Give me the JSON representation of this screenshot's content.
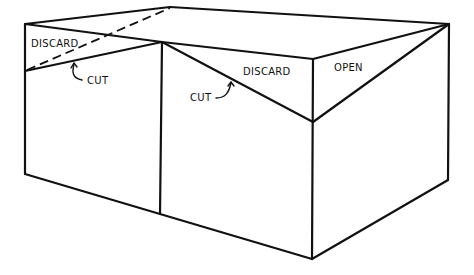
{
  "diagram": {
    "type": "line-drawing",
    "stroke_color": "#111111",
    "background": "#ffffff",
    "labels": {
      "discard_left": "DISCARD",
      "cut_left": "CUT",
      "discard_right": "DISCARD",
      "cut_right": "CUT",
      "open": "OPEN"
    }
  }
}
